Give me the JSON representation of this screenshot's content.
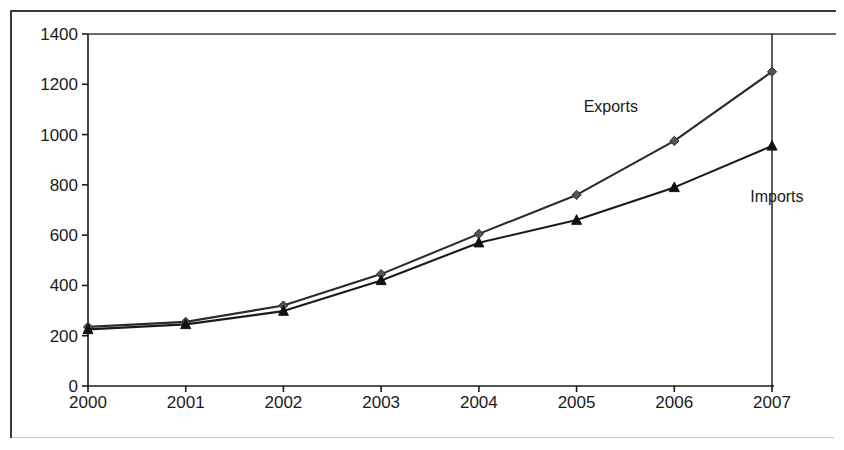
{
  "chart_data": {
    "type": "line",
    "title": "",
    "xlabel": "",
    "ylabel": "",
    "categories": [
      "2000",
      "2001",
      "2002",
      "2003",
      "2004",
      "2005",
      "2006",
      "2007"
    ],
    "x_tick_labels": [
      "2000",
      "2001",
      "2002",
      "2003",
      "2004",
      "2005",
      "2006",
      "2007"
    ],
    "y_tick_labels": [
      "0",
      "200",
      "400",
      "600",
      "800",
      "1000",
      "1200",
      "1400"
    ],
    "y_ticks": [
      0,
      200,
      400,
      600,
      800,
      1000,
      1200,
      1400
    ],
    "ylim": [
      0,
      1400
    ],
    "grid": false,
    "legend_position": "inline-annotation",
    "series": [
      {
        "name": "Exports",
        "marker": "diamond",
        "color": "#2b2b2b",
        "values": [
          235,
          255,
          320,
          445,
          605,
          760,
          975,
          1250
        ]
      },
      {
        "name": "Imports",
        "marker": "triangle",
        "color": "#1a1a1a",
        "values": [
          225,
          245,
          298,
          420,
          570,
          660,
          790,
          955
        ]
      }
    ],
    "annotations": [
      {
        "text": "Exports",
        "x": 2005.35,
        "y": 1090
      },
      {
        "text": "Imports",
        "x": 2007.05,
        "y": 730
      }
    ]
  },
  "colors": {
    "axis": "#1a1a1a",
    "frame": "#3a3a3a",
    "background": "#ffffff"
  }
}
